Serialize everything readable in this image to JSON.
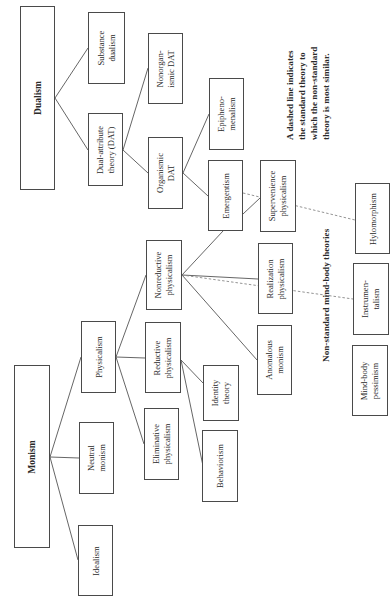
{
  "diagram": {
    "orientation": "rotated-90-ccw",
    "nodes": {
      "dualism": {
        "label": "Dualism"
      },
      "substance_dualism": {
        "label_lines": [
          "Substance",
          "dualism"
        ]
      },
      "dat": {
        "label_lines": [
          "Dual-attribute",
          "theory (DAT)"
        ]
      },
      "nonorganismic_dat": {
        "label_lines": [
          "Nonorgan-",
          "ismic DAT"
        ]
      },
      "organismic_dat": {
        "label_lines": [
          "Organismic",
          "DAT"
        ]
      },
      "epiphenomenalism": {
        "label_lines": [
          "Epipheno-",
          "menalism"
        ]
      },
      "emergentism": {
        "label": "Emergentism"
      },
      "supervenience_physicalism": {
        "label_lines": [
          "Supervenience",
          "physicalism"
        ]
      },
      "monism": {
        "label": "Monism"
      },
      "physicalism": {
        "label": "Physicalism"
      },
      "neutral_monism": {
        "label_lines": [
          "Neutral",
          "monism"
        ]
      },
      "idealism": {
        "label": "Idealism"
      },
      "nonreductive_physicalism": {
        "label_lines": [
          "Nonreductive",
          "physicalism"
        ]
      },
      "reductive_physicalism": {
        "label_lines": [
          "Reductive",
          "physicalism"
        ]
      },
      "eliminative_physicalism": {
        "label_lines": [
          "Eliminative",
          "physicalism"
        ]
      },
      "realization_physicalism": {
        "label_lines": [
          "Realization",
          "physicalism"
        ]
      },
      "anomalous_monism": {
        "label_lines": [
          "Anomalous",
          "monism"
        ]
      },
      "identity_theory": {
        "label_lines": [
          "Identity",
          "theory"
        ]
      },
      "behaviorism": {
        "label": "Behaviorism"
      },
      "hylomorphism": {
        "label": "Hylomorphism"
      },
      "instrumentalism": {
        "label_lines": [
          "Instrumen-",
          "talism"
        ]
      },
      "mind_body_pessimism": {
        "label_lines": [
          "Mind-body",
          "pessimism"
        ]
      }
    },
    "edges": [
      [
        "dualism",
        "substance_dualism"
      ],
      [
        "dualism",
        "dat"
      ],
      [
        "dat",
        "nonorganismic_dat"
      ],
      [
        "dat",
        "organismic_dat"
      ],
      [
        "organismic_dat",
        "epiphenomenalism"
      ],
      [
        "organismic_dat",
        "emergentism"
      ],
      [
        "emergentism",
        "supervenience_physicalism"
      ],
      [
        "monism",
        "physicalism"
      ],
      [
        "monism",
        "neutral_monism"
      ],
      [
        "monism",
        "idealism"
      ],
      [
        "physicalism",
        "nonreductive_physicalism"
      ],
      [
        "physicalism",
        "reductive_physicalism"
      ],
      [
        "physicalism",
        "eliminative_physicalism"
      ],
      [
        "nonreductive_physicalism",
        "emergentism"
      ],
      [
        "nonreductive_physicalism",
        "realization_physicalism"
      ],
      [
        "nonreductive_physicalism",
        "anomalous_monism"
      ],
      [
        "reductive_physicalism",
        "identity_theory"
      ],
      [
        "reductive_physicalism",
        "behaviorism"
      ]
    ],
    "dashed_edges": [
      [
        "emergentism",
        "hylomorphism"
      ],
      [
        "nonreductive_physicalism",
        "instrumentalism"
      ]
    ],
    "nonstandard_heading": "Non-standard mind-body theories",
    "note_lines": [
      "A dashed line indicates",
      "the standard theory to",
      "which the non-standard",
      "theory is most similar."
    ]
  }
}
